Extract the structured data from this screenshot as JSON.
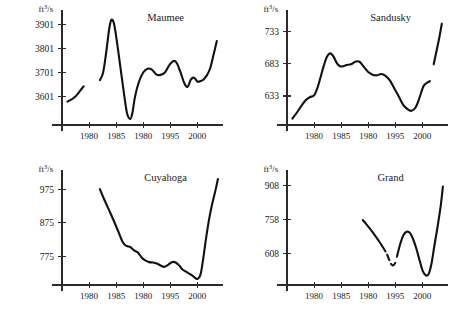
{
  "figure": {
    "name": "four-panel-streamflow-time-series",
    "panel_count": 4,
    "line_color": "#111111",
    "axis_color": "#2b2b2b",
    "background": "#ffffff"
  },
  "chart_data": [
    {
      "type": "line",
      "title": "Maumee",
      "xlabel": "",
      "ylabel": "ft³/s",
      "ylabel_html": "ft3/s",
      "grid": false,
      "legend": null,
      "xlim": [
        1975,
        2004
      ],
      "ylim": [
        3480,
        3945
      ],
      "xticks": [
        1980,
        1985,
        1990,
        1995,
        2000
      ],
      "xticklabels": [
        "1980",
        "1985",
        "1980",
        "1995",
        "2000"
      ],
      "yticks": [
        3601,
        3701,
        3801,
        3901
      ],
      "yticklabels": [
        "3601",
        "3701",
        "3801",
        "3901"
      ],
      "segments": [
        {
          "x": [
            1976.0,
            1976.6,
            1977.2,
            1977.8,
            1978.4,
            1979.0
          ],
          "y": [
            3578,
            3585,
            3594,
            3607,
            3625,
            3642
          ]
        },
        {
          "x": [
            1982.0,
            1982.6,
            1983.2,
            1983.7,
            1984.1,
            1984.6,
            1985.2,
            1985.8,
            1986.4,
            1987.0,
            1987.6,
            1988.0,
            1988.5,
            1989.2,
            1990.0,
            1990.8,
            1991.6,
            1992.4,
            1993.2,
            1994.0,
            1994.8,
            1995.6,
            1996.2,
            1996.9,
            1997.6,
            1998.2,
            1998.8,
            1999.4,
            2000.0,
            2000.6,
            2001.2,
            2001.8,
            2002.4,
            2003.0,
            2003.6
          ],
          "y": [
            3668,
            3700,
            3790,
            3880,
            3920,
            3905,
            3820,
            3720,
            3620,
            3530,
            3505,
            3530,
            3600,
            3660,
            3700,
            3716,
            3712,
            3692,
            3690,
            3700,
            3730,
            3748,
            3740,
            3700,
            3655,
            3640,
            3670,
            3678,
            3662,
            3664,
            3672,
            3690,
            3720,
            3775,
            3832
          ]
        }
      ]
    },
    {
      "type": "line",
      "title": "Sandusky",
      "xlabel": "",
      "ylabel": "ft³/s",
      "ylabel_html": "ft3/s",
      "grid": false,
      "legend": null,
      "xlim": [
        1975,
        2004
      ],
      "ylim": [
        588,
        760
      ],
      "xticks": [
        1980,
        1985,
        1990,
        1995,
        2000
      ],
      "xticklabels": [
        "1980",
        "1985",
        "1980",
        "1995",
        "2000"
      ],
      "yticks": [
        633,
        683,
        733
      ],
      "yticklabels": [
        "633",
        "683",
        "733"
      ],
      "segments": [
        {
          "x": [
            1976.0,
            1976.8,
            1977.6,
            1978.4,
            1979.2,
            1980.0,
            1980.6,
            1981.2,
            1981.8,
            1982.4,
            1983.0,
            1983.6,
            1984.2,
            1984.8,
            1985.4,
            1986.0,
            1986.8,
            1987.6,
            1988.4,
            1989.2,
            1990.0,
            1990.8,
            1991.6,
            1992.4,
            1993.2,
            1994.0,
            1994.8,
            1995.6,
            1996.4,
            1997.2,
            1998.0,
            1998.8,
            1999.5,
            2000.2,
            2000.8,
            2001.4
          ],
          "y": [
            598,
            607,
            617,
            626,
            631,
            634,
            645,
            662,
            680,
            694,
            699,
            694,
            684,
            679,
            679,
            681,
            682,
            686,
            686,
            678,
            670,
            666,
            665,
            667,
            664,
            657,
            645,
            633,
            620,
            613,
            610,
            616,
            631,
            648,
            653,
            656
          ]
        },
        {
          "x": [
            2002.1,
            2002.6,
            2003.1,
            2003.6
          ],
          "y": [
            682,
            702,
            722,
            745
          ]
        }
      ]
    },
    {
      "type": "line",
      "title": "Cuyahoga",
      "xlabel": "",
      "ylabel": "ft³/s",
      "ylabel_html": "ft3/s",
      "grid": false,
      "legend": null,
      "xlim": [
        1975,
        2004
      ],
      "ylim": [
        690,
        1020
      ],
      "xticks": [
        1980,
        1985,
        1990,
        1995,
        2000
      ],
      "xticklabels": [
        "1980",
        "1985",
        "1980",
        "1995",
        "2000"
      ],
      "yticks": [
        775,
        875,
        975
      ],
      "yticklabels": [
        "775",
        "875",
        "975"
      ],
      "segments": [
        {
          "x": [
            1982.0,
            1982.7,
            1983.4,
            1984.1,
            1984.8,
            1985.5,
            1986.2,
            1986.9,
            1987.6,
            1988.3,
            1989.0,
            1989.7,
            1990.4,
            1991.1,
            1991.8,
            1992.5,
            1993.2,
            1993.9,
            1994.6,
            1995.3,
            1996.0,
            1996.7,
            1997.2,
            1997.9,
            1998.6,
            1999.3,
            2000.0,
            2000.6,
            2001.1,
            2001.6,
            2002.2,
            2002.8,
            2003.4,
            2003.8
          ],
          "y": [
            975,
            948,
            923,
            898,
            872,
            845,
            818,
            806,
            803,
            793,
            787,
            772,
            763,
            758,
            757,
            754,
            748,
            744,
            750,
            758,
            757,
            747,
            737,
            730,
            723,
            715,
            708,
            722,
            770,
            828,
            888,
            935,
            975,
            1005
          ]
        }
      ]
    },
    {
      "type": "line",
      "title": "Grand",
      "xlabel": "",
      "ylabel": "ft³/s",
      "ylabel_html": "ft3/s",
      "grid": false,
      "legend": null,
      "xlim": [
        1975,
        2004
      ],
      "ylim": [
        470,
        960
      ],
      "xticks": [
        1980,
        1985,
        1990,
        1995,
        2000
      ],
      "xticklabels": [
        "1980",
        "1985",
        "1980",
        "1995",
        "2000"
      ],
      "yticks": [
        608,
        758,
        908
      ],
      "yticklabels": [
        "608",
        "758",
        "908"
      ],
      "segments": [
        {
          "x": [
            1989.0,
            1989.6,
            1990.2,
            1990.8,
            1991.4,
            1992.0,
            1992.6,
            1993.2
          ],
          "y": [
            757,
            740,
            722,
            703,
            684,
            663,
            641,
            618
          ]
        },
        {
          "x": [
            1993.5,
            1993.9
          ],
          "y": [
            604,
            580
          ]
        },
        {
          "x": [
            1994.2,
            1994.6,
            1995.0
          ],
          "y": [
            563,
            556,
            568
          ]
        },
        {
          "x": [
            1995.3,
            1995.9,
            1996.5,
            1997.1,
            1997.7,
            1998.3,
            1998.9,
            1999.5,
            2000.1,
            2000.7,
            2001.2,
            2001.7,
            2002.2,
            2002.8,
            2003.4,
            2003.8
          ],
          "y": [
            595,
            650,
            690,
            705,
            700,
            672,
            630,
            578,
            530,
            512,
            520,
            566,
            640,
            725,
            820,
            905
          ]
        }
      ]
    }
  ]
}
